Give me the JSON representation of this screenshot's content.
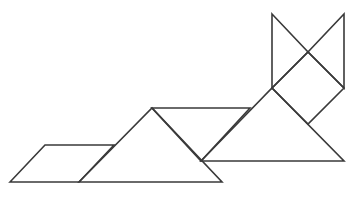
{
  "diagram": {
    "title": "",
    "stroke_color": "#3a3a3a",
    "background_color": "#ffffff",
    "pieces": [
      {
        "name": "parallelogram",
        "points": "10,182 45,145 114,145 79,182"
      },
      {
        "name": "large-triangle-body",
        "points": "79,182 152,108 222,182"
      },
      {
        "name": "medium-piece-back",
        "points": "152,108 250,108 201,161"
      },
      {
        "name": "large-triangle-chest",
        "points": "201,161 272,88 344,161"
      },
      {
        "name": "square-head",
        "points": "272,88 308,52 344,88 308,124"
      },
      {
        "name": "left-ear-triangle",
        "points": "272,14 308,52 272,88"
      },
      {
        "name": "right-ear-triangle",
        "points": "344,14 344,88 308,52"
      }
    ]
  }
}
